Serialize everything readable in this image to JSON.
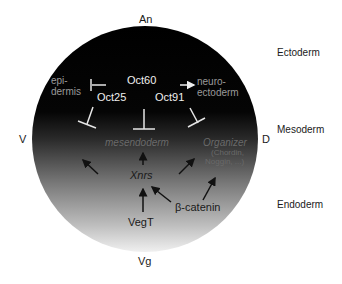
{
  "poles": {
    "animal": "An",
    "vegetal": "Vg",
    "ventral": "V",
    "dorsal": "D"
  },
  "germ_layers": [
    "Ectoderm",
    "Mesoderm",
    "Endoderm"
  ],
  "nodes": {
    "epidermis_line1": "epi-",
    "epidermis_line2": "dermis",
    "oct60": "Oct60",
    "oct25": "Oct25",
    "oct91": "Oct91",
    "neuroectoderm_line1": "neuro-",
    "neuroectoderm_line2": "ectoderm",
    "mesendoderm": "mesendoderm",
    "organizer": "Organizer",
    "organizer_genes_line1": "(Chordin,",
    "organizer_genes_line2": "Noggin, ...)",
    "xnrs": "Xnrs",
    "vegt": "VegT",
    "beta_catenin": "β-catenin"
  },
  "colors": {
    "circle_top": "#000000",
    "circle_bottom": "#f2f2f2",
    "inhibition_lines": "#e8e8e8",
    "activation_arrows": "#111111"
  }
}
